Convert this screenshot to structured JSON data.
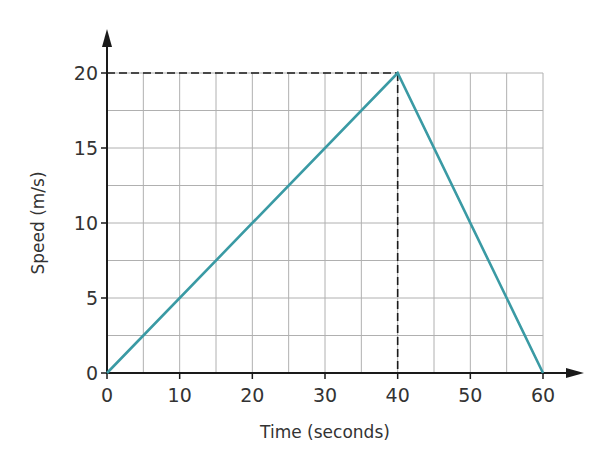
{
  "chart_data": {
    "type": "line",
    "title": "",
    "xlabel": "Time (seconds)",
    "ylabel": "Speed (m/s)",
    "xlim": [
      0,
      60
    ],
    "ylim": [
      0,
      20
    ],
    "x_ticks": [
      0,
      10,
      20,
      30,
      40,
      50,
      60
    ],
    "y_ticks": [
      0,
      5,
      10,
      15,
      20
    ],
    "x_tick_labels": [
      "0",
      "10",
      "20",
      "30",
      "40",
      "50",
      "60"
    ],
    "y_tick_labels": [
      "0",
      "5",
      "10",
      "15",
      "20"
    ],
    "grid": true,
    "grid_x_step": 5,
    "grid_y_step": 2.5,
    "legend": null,
    "series": [
      {
        "name": "Speed",
        "color": "#3a9aa4",
        "x": [
          0,
          40,
          60
        ],
        "y": [
          0,
          20,
          0
        ]
      }
    ],
    "annotations": [
      {
        "type": "dashed-guide",
        "description": "Horizontal dashed line from y-axis at 20 to peak (40, 20)",
        "from": [
          0,
          20
        ],
        "to": [
          40,
          20
        ]
      },
      {
        "type": "dashed-guide",
        "description": "Vertical dashed line from peak (40, 20) down to x-axis at 40",
        "from": [
          40,
          20
        ],
        "to": [
          40,
          0
        ]
      }
    ]
  },
  "colors": {
    "line": "#3a9aa4",
    "grid": "#b0b0b0",
    "axis": "#1a1a1a",
    "text": "#333333"
  }
}
